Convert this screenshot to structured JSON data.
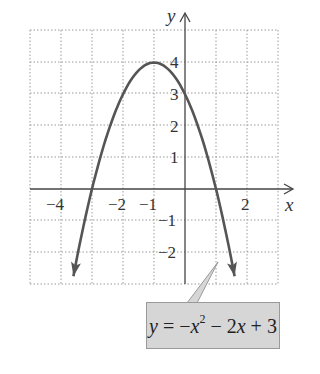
{
  "chart_data": {
    "type": "line",
    "title": "",
    "xlabel": "x",
    "ylabel": "y",
    "xlim": [
      -5,
      3
    ],
    "ylim": [
      -3,
      5
    ],
    "grid": true,
    "x_tick_labels": [
      "-4",
      "-2",
      "-1",
      "2"
    ],
    "x_tick_values": [
      -4,
      -2,
      -1,
      2
    ],
    "y_tick_labels": [
      "4",
      "3",
      "2",
      "1",
      "-1",
      "-2"
    ],
    "y_tick_values": [
      4,
      3,
      2,
      1,
      -1,
      -2
    ],
    "series": [
      {
        "name": "y = -x^2 - 2x + 3",
        "equation": "y = -x^2 - 2x + 3",
        "x_range": [
          -3.6,
          1.6
        ],
        "vertex": [
          -1,
          4
        ],
        "y_intercept": 3,
        "x_intercepts": [
          -3,
          1
        ],
        "x": [
          -3.6,
          -3,
          -2.5,
          -2,
          -1.5,
          -1,
          -0.5,
          0,
          0.5,
          1,
          1.6
        ],
        "values": [
          -2.76,
          0,
          1.75,
          3,
          3.75,
          4,
          3.75,
          3,
          1.75,
          0,
          -2.76
        ],
        "color": "#555555",
        "arrows_at_ends": true
      }
    ],
    "annotation": {
      "text": "y = −x² − 2x + 3",
      "box_color": "#d6d6d6",
      "points_to": [
        1.05,
        -2.3
      ]
    }
  },
  "labels": {
    "x_axis": "x",
    "y_axis": "y",
    "xt_m4": "−4",
    "xt_m2": "−2",
    "xt_m1": "−1",
    "xt_2": "2",
    "yt_4": "4",
    "yt_3": "3",
    "yt_2": "2",
    "yt_1": "1",
    "yt_m1": "−1",
    "yt_m2": "−2"
  },
  "equation": {
    "y": "y",
    "eq": " = −",
    "x1": "x",
    "exp": "2",
    "mid": " − 2",
    "x2": "x",
    "end": " + 3"
  }
}
